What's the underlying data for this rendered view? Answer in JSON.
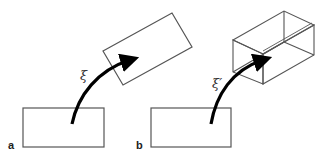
{
  "figure": {
    "panels": [
      {
        "id": "a",
        "label": "a",
        "transform_symbol": "ξ",
        "source_shape": "rectangle",
        "target_shape": "rotated-rectangle"
      },
      {
        "id": "b",
        "label": "b",
        "transform_symbol": "ξ′",
        "source_shape": "rectangle",
        "target_shape": "wireframe-box"
      }
    ],
    "colors": {
      "stroke": "#555555",
      "arrow": "#000000",
      "background": "#ffffff"
    }
  }
}
